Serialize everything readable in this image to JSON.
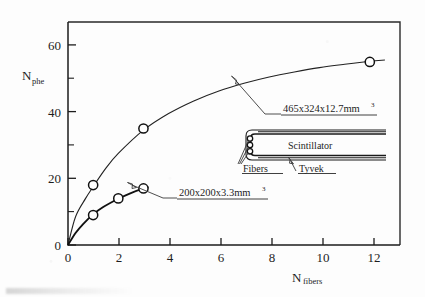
{
  "chart_data": {
    "type": "scatter",
    "title": "",
    "subtitle": "",
    "xlabel": "N",
    "xlabel_sub": "fibers",
    "ylabel": "N",
    "ylabel_sub": "phe",
    "xlim": [
      0,
      13.2
    ],
    "ylim": [
      0,
      67
    ],
    "grid": false,
    "legend_position": "inline-annotations",
    "x_ticks": [
      "0",
      "2",
      "4",
      "6",
      "8",
      "10",
      "12"
    ],
    "x_tick_values": [
      0,
      2,
      4,
      6,
      8,
      10,
      12
    ],
    "x_minor_values": [
      1,
      3,
      5,
      7,
      9,
      11,
      13
    ],
    "y_ticks": [
      "0",
      "20",
      "40",
      "60"
    ],
    "y_tick_values": [
      0,
      20,
      40,
      60
    ],
    "y_minor_values": [
      10,
      30,
      50
    ],
    "series": [
      {
        "name": "465x324x12.7mm3",
        "marker": "open-circle",
        "line": "thin",
        "points": [
          {
            "x": 1,
            "y": 18
          },
          {
            "x": 3,
            "y": 35
          },
          {
            "x": 12,
            "y": 55
          }
        ],
        "curve": [
          {
            "x": 0,
            "y": 0
          },
          {
            "x": 0.3,
            "y": 8.5
          },
          {
            "x": 0.7,
            "y": 14.0
          },
          {
            "x": 1.0,
            "y": 17.5
          },
          {
            "x": 1.5,
            "y": 23.0
          },
          {
            "x": 2.0,
            "y": 27.5
          },
          {
            "x": 3.0,
            "y": 34.5
          },
          {
            "x": 4.0,
            "y": 39.5
          },
          {
            "x": 5.0,
            "y": 43.3
          },
          {
            "x": 6.0,
            "y": 46.3
          },
          {
            "x": 7.0,
            "y": 48.6
          },
          {
            "x": 8.0,
            "y": 50.5
          },
          {
            "x": 9.0,
            "y": 52.0
          },
          {
            "x": 10.0,
            "y": 53.3
          },
          {
            "x": 11.0,
            "y": 54.3
          },
          {
            "x": 12.0,
            "y": 55.2
          },
          {
            "x": 12.6,
            "y": 55.6
          }
        ]
      },
      {
        "name": "200x200x3.3mm3",
        "marker": "open-circle",
        "line": "thick",
        "points": [
          {
            "x": 1,
            "y": 9
          },
          {
            "x": 2,
            "y": 14
          },
          {
            "x": 3,
            "y": 17
          }
        ],
        "curve": [
          {
            "x": 0,
            "y": 0
          },
          {
            "x": 0.3,
            "y": 3.6
          },
          {
            "x": 0.6,
            "y": 6.3
          },
          {
            "x": 1.0,
            "y": 9.2
          },
          {
            "x": 1.4,
            "y": 11.4
          },
          {
            "x": 2.0,
            "y": 13.9
          },
          {
            "x": 2.5,
            "y": 15.6
          },
          {
            "x": 3.0,
            "y": 17.0
          },
          {
            "x": 3.2,
            "y": 17.4
          }
        ]
      }
    ],
    "annotations": [
      {
        "id": "annotation-upper",
        "text": "465x324x12.7mm",
        "superscript": "3",
        "target_x": 7.0,
        "target_y": 48.6,
        "underline": true
      },
      {
        "id": "annotation-lower",
        "text": "200x200x3.3mm",
        "superscript": "3",
        "target_x": 2.6,
        "target_y": 16.4,
        "underline": true
      }
    ]
  },
  "inset": {
    "name": "scintillator-fiber-schematic",
    "labels": {
      "scintillator": "Scintillator",
      "fibers": "Fibers",
      "tyvek": "Tyvek"
    },
    "fiber_count": 3
  },
  "colors": {
    "ink": "#1d1d1d",
    "paper": "#fdfdfd",
    "curve_thin": "#222222",
    "curve_thick": "#111111",
    "marker_fill": "#ffffff",
    "leader": "#3a3a3a"
  }
}
